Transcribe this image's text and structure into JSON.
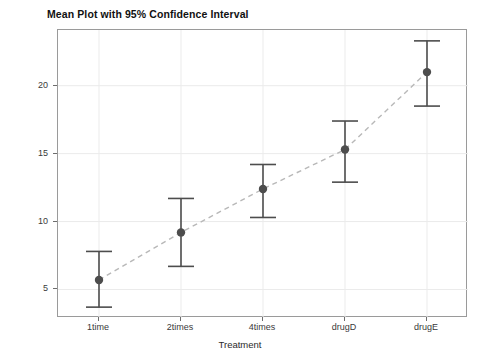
{
  "chart_data": {
    "type": "scatter",
    "title": "Mean Plot with 95% Confidence Interval",
    "xlabel": "Treatment",
    "ylabel": "Response",
    "categories": [
      "1time",
      "2times",
      "4times",
      "drugD",
      "drugE"
    ],
    "values": [
      5.7,
      9.2,
      12.4,
      15.3,
      21.0
    ],
    "ci_lower": [
      3.7,
      6.7,
      10.3,
      12.9,
      18.5
    ],
    "ci_upper": [
      7.8,
      11.7,
      14.2,
      17.4,
      23.3
    ],
    "ylim": [
      2.9,
      24.1
    ],
    "yticks": [
      5,
      10,
      15,
      20
    ],
    "ytick_labels": [
      "5",
      "10",
      "15",
      "20"
    ],
    "grid": true,
    "legend": "none",
    "series": [
      {
        "name": "Mean with 95% CI",
        "values": [
          5.7,
          9.2,
          12.4,
          15.3,
          21.0
        ]
      }
    ],
    "colors": {
      "marker": "#4d4d4d",
      "errorbar": "#4d4d4d",
      "connector": "#b8b8b8",
      "grid": "#ebebeb",
      "frame": "#9a9a9a",
      "text": "#2b2b2b"
    },
    "connector_style": "dashed",
    "marker_style": "filled-circle"
  }
}
